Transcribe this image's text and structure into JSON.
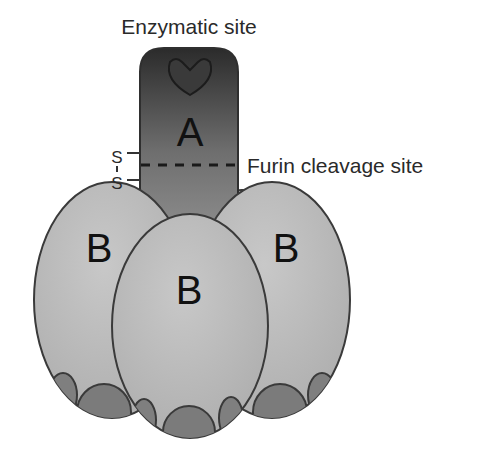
{
  "diagram": {
    "labels": {
      "enzymatic_site": "Enzymatic site",
      "furin_cleavage_site": "Furin cleavage site",
      "disulfide_top": "S",
      "disulfide_bond": "|",
      "disulfide_bottom": "S"
    },
    "subunits": {
      "a": {
        "label": "A",
        "color_top": "#2e2e2e",
        "color_bottom": "#8a8a8a"
      },
      "b_left": {
        "label": "B",
        "fill": "#b9b9b9"
      },
      "b_center": {
        "label": "B",
        "fill": "#bdbdbd"
      },
      "b_right": {
        "label": "B",
        "fill": "#b9b9b9"
      }
    },
    "colors": {
      "outline": "#3a3a3a",
      "receptor_blob": "#7d7d7d",
      "background": "#ffffff"
    }
  }
}
